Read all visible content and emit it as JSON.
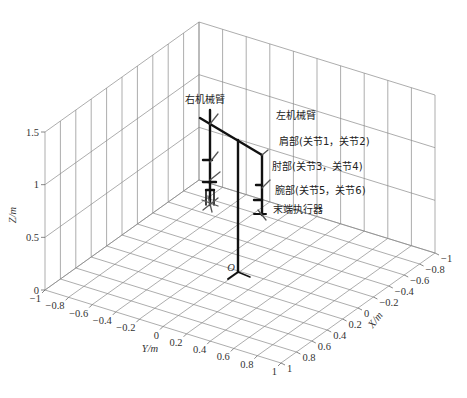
{
  "chart_data": {
    "type": "3d-line",
    "title": "",
    "axes": {
      "x": {
        "label": "X/m",
        "range": [
          -1,
          1
        ],
        "ticks": [
          "-1",
          "-0.8",
          "-0.6",
          "-0.4",
          "-0.2",
          "0",
          "0.2",
          "0.4",
          "0.6",
          "0.8",
          "1"
        ]
      },
      "y": {
        "label": "Y/m",
        "range": [
          -1,
          1
        ],
        "ticks": [
          "-1",
          "-0.8",
          "-0.6",
          "-0.4",
          "-0.2",
          "0",
          "0.2",
          "0.4",
          "0.6",
          "0.8",
          "1"
        ]
      },
      "z": {
        "label": "Z/m",
        "range": [
          0,
          1.5
        ],
        "ticks": [
          "0",
          "0.5",
          "1",
          "1.5"
        ]
      }
    },
    "grid": true,
    "origin_label": "O",
    "annotations": [
      {
        "text": "右机械臂",
        "target": "right-arm"
      },
      {
        "text": "左机械臂",
        "target": "left-arm"
      },
      {
        "text": "肩部(关节1，关节2)",
        "target": "shoulder-joints"
      },
      {
        "text": "肘部(关节3，关节4)",
        "target": "elbow-joints"
      },
      {
        "text": "腕部(关节5，关节6)",
        "target": "wrist-joints"
      },
      {
        "text": "末端执行器",
        "target": "end-effector"
      }
    ]
  },
  "labels": {
    "right_arm": "右机械臂",
    "left_arm": "左机械臂",
    "shoulder": "肩部(关节1，关节2)",
    "elbow": "肘部(关节3，关节4)",
    "wrist": "腕部(关节5，关节6)",
    "end_effector": "末端执行器",
    "origin": "O",
    "z_axis": "Z/m",
    "y_axis": "Y/m",
    "x_axis": "X/m"
  }
}
